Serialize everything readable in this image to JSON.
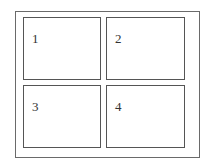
{
  "diagram": {
    "type": "2x2 grid of panels inside a frame",
    "colors": {
      "background": "#ffffff",
      "frame_border": "#6a6a6a",
      "panel_border": "#555555",
      "label_text": "#333333"
    },
    "panels": [
      {
        "label": "1"
      },
      {
        "label": "2"
      },
      {
        "label": "3"
      },
      {
        "label": "4"
      }
    ]
  }
}
